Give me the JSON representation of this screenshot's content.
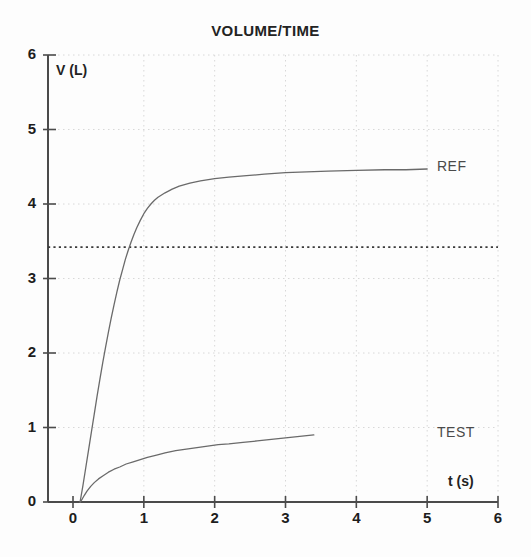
{
  "chart_data": {
    "type": "line",
    "title": "VOLUME/TIME",
    "xlabel": "t (s)",
    "ylabel": "V (L)",
    "xlim": [
      0,
      6
    ],
    "ylim": [
      0,
      6
    ],
    "xticks": [
      0,
      1,
      2,
      3,
      4,
      5,
      6
    ],
    "yticks": [
      0,
      1,
      2,
      3,
      4,
      5,
      6
    ],
    "xtick_labels": [
      "0",
      "1",
      "2",
      "3",
      "4",
      "5",
      "6"
    ],
    "ytick_labels": [
      "0",
      "1",
      "2",
      "3",
      "4",
      "5",
      "6"
    ],
    "grid": true,
    "grid_style": "dotted",
    "legend_position": "inline-right-of-curve",
    "colors": {
      "axis": "#4b4b4b",
      "grid": "#d8d8d8",
      "curve": "#6a6a6a",
      "reference_line": "#3a3a3a",
      "text": "#1d1d1d"
    },
    "annotations": [
      {
        "name": "reference-threshold-line",
        "type": "horizontal-dotted-line",
        "y": 3.42,
        "x_start": 0,
        "x_end": 6
      }
    ],
    "series": [
      {
        "name": "REF",
        "label": "REF",
        "style": "solid",
        "x": [
          0.1,
          0.14,
          0.18,
          0.22,
          0.26,
          0.3,
          0.34,
          0.38,
          0.42,
          0.46,
          0.5,
          0.54,
          0.58,
          0.62,
          0.66,
          0.7,
          0.74,
          0.78,
          0.82,
          0.86,
          0.9,
          0.95,
          1.0,
          1.05,
          1.1,
          1.15,
          1.2,
          1.3,
          1.4,
          1.5,
          1.65,
          1.8,
          2.0,
          2.2,
          2.45,
          2.7,
          3.0,
          3.3,
          3.6,
          4.0,
          4.4,
          4.7,
          5.0
        ],
        "y": [
          0.0,
          0.22,
          0.46,
          0.7,
          0.94,
          1.18,
          1.42,
          1.65,
          1.87,
          2.08,
          2.28,
          2.47,
          2.65,
          2.82,
          2.98,
          3.12,
          3.26,
          3.38,
          3.49,
          3.59,
          3.68,
          3.78,
          3.87,
          3.94,
          4.0,
          4.05,
          4.09,
          4.15,
          4.2,
          4.24,
          4.28,
          4.31,
          4.34,
          4.36,
          4.38,
          4.4,
          4.42,
          4.43,
          4.44,
          4.45,
          4.46,
          4.46,
          4.47
        ]
      },
      {
        "name": "TEST",
        "label": "TEST",
        "style": "solid",
        "x": [
          0.1,
          0.13,
          0.16,
          0.2,
          0.25,
          0.3,
          0.36,
          0.42,
          0.5,
          0.58,
          0.66,
          0.75,
          0.85,
          0.95,
          1.05,
          1.18,
          1.3,
          1.45,
          1.6,
          1.75,
          1.9,
          2.05,
          2.2,
          2.4,
          2.6,
          2.8,
          3.0,
          3.2,
          3.4
        ],
        "y": [
          0.0,
          0.04,
          0.09,
          0.15,
          0.21,
          0.26,
          0.31,
          0.35,
          0.4,
          0.44,
          0.47,
          0.51,
          0.54,
          0.57,
          0.6,
          0.63,
          0.66,
          0.69,
          0.71,
          0.73,
          0.75,
          0.77,
          0.78,
          0.8,
          0.82,
          0.84,
          0.86,
          0.88,
          0.9
        ]
      }
    ]
  }
}
